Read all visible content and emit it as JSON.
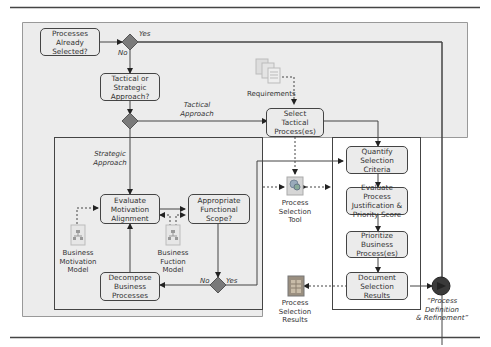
{
  "diagram": {
    "nodes": {
      "processes_already_selected": "Processes\nAlready\nSelected?",
      "tactical_or_strategic": "Tactical or\nStrategic\nApproach?",
      "select_tactical": "Select\nTactical\nProcess(es)",
      "quantify_criteria": "Quantify\nSelection\nCriteria",
      "evaluate_process": "Evaluate Process\nJustification &\nPriority Score",
      "prioritize_business": "Prioritize Business\nProcess(es)",
      "document_results": "Document\nSelection Results",
      "evaluate_motivation": "Evaluate\nMotivation\nAlignment",
      "appropriate_scope": "Appropriate\nFunctional\nScope?",
      "decompose_business": "Decompose\nBusiness\nProcesses"
    },
    "edge_labels": {
      "yes_top": "Yes",
      "no_top": "No",
      "tactical_approach": "Tactical\nApproach",
      "strategic_approach": "Strategic\nApproach",
      "no_bottom": "No",
      "yes_bottom": "Yes"
    },
    "artifacts": {
      "requirements": "Requirements",
      "process_selection_tool": "Process\nSelection\nTool",
      "business_motivation_model": "Business\nMotivation\nModel",
      "business_function_model": "Business\nFuction\nModel",
      "process_selection_results": "Process\nSelection\nResults"
    },
    "end_event": "“Process\nDefinition\n& Refinement”"
  },
  "colors": {
    "panel_fill": "#ececec",
    "node_fill": "#ebebeb",
    "diamond_fill": "#7a7a7a",
    "line": "#444444",
    "end_circle": "#3a3a3a"
  }
}
